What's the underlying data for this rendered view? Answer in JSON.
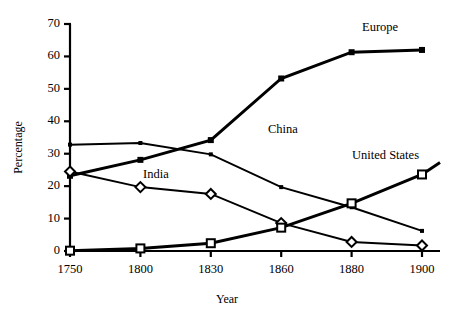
{
  "chart_data": {
    "type": "line",
    "title": "",
    "xlabel": "Year",
    "ylabel": "Percentage",
    "categories": [
      "1750",
      "1800",
      "1830",
      "1860",
      "1880",
      "1900"
    ],
    "ylim": [
      0,
      70
    ],
    "yticks": [
      "0",
      "10",
      "20",
      "30",
      "40",
      "50",
      "60",
      "70"
    ],
    "ytick_values": [
      0,
      10,
      20,
      30,
      40,
      50,
      60,
      70
    ],
    "grid": false,
    "legend_position": "inline-labels",
    "series": [
      {
        "name": "Europe",
        "marker": "filled-square",
        "label": "Europe",
        "values": [
          23.2,
          28.1,
          34.2,
          53.2,
          61.3,
          62.0
        ]
      },
      {
        "name": "China",
        "marker": "dot",
        "label": "China",
        "values": [
          32.8,
          33.3,
          29.8,
          19.7,
          13.5,
          6.2
        ]
      },
      {
        "name": "India",
        "marker": "open-diamond",
        "label": "India",
        "values": [
          24.5,
          19.7,
          17.6,
          8.6,
          2.8,
          1.7
        ]
      },
      {
        "name": "United States",
        "marker": "open-square",
        "label": "United States",
        "values": [
          0.1,
          0.8,
          2.4,
          7.2,
          14.7,
          23.6
        ]
      }
    ]
  },
  "annotations": {
    "europe_label": "Europe",
    "china_label": "China",
    "india_label": "India",
    "united_states_label": "United States"
  }
}
